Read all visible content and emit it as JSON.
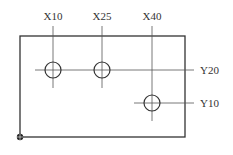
{
  "diagram": {
    "type": "hole-pattern-drawing",
    "colors": {
      "stroke": "#333333",
      "background": "#ffffff"
    },
    "plate": {
      "x": 20,
      "y": 36,
      "width": 165,
      "height": 101
    },
    "origin": {
      "x": 20,
      "y": 137,
      "r": 3,
      "label": ""
    },
    "x_lines": [
      {
        "label": "X10",
        "x": 53,
        "top": 26,
        "bottom": 88,
        "label_x": 53,
        "label_y": 20
      },
      {
        "label": "X25",
        "x": 102,
        "top": 26,
        "bottom": 88,
        "label_x": 102,
        "label_y": 20
      },
      {
        "label": "X40",
        "x": 152,
        "top": 26,
        "bottom": 121,
        "label_x": 152,
        "label_y": 20
      }
    ],
    "y_lines": [
      {
        "label": "Y20",
        "y": 70,
        "left": 35,
        "right": 194,
        "label_x": 200,
        "label_y": 74
      },
      {
        "label": "Y10",
        "y": 103,
        "left": 134,
        "right": 194,
        "label_x": 200,
        "label_y": 107
      }
    ],
    "holes": [
      {
        "name": "hole-x10-y20",
        "cx": 53,
        "cy": 70,
        "r": 8
      },
      {
        "name": "hole-x25-y20",
        "cx": 102,
        "cy": 70,
        "r": 8
      },
      {
        "name": "hole-x40-y10",
        "cx": 152,
        "cy": 103,
        "r": 8
      }
    ]
  },
  "labels": {
    "x10": "X10",
    "x25": "X25",
    "x40": "X40",
    "y20": "Y20",
    "y10": "Y10"
  }
}
